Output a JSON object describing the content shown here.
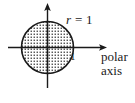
{
  "figure": {
    "name": "polar-circle-r-equals-1",
    "background_color": "#ffffff",
    "ink_color": "#1a1a1a",
    "labels": {
      "radius_label_variable": "r",
      "radius_label_equals": " = ",
      "radius_label_value": "1",
      "radius_label_full": "r = 1",
      "tick_label": "1",
      "axis_label_line1": "polar",
      "axis_label_line2": "axis"
    },
    "geometry": {
      "center_x": 47.5,
      "center_y": 47.5,
      "radius_px": 26.5,
      "radius_value": 1,
      "horizontal_axis_start_x": 8,
      "horizontal_axis_end_x": 107,
      "vertical_axis_top_y": 3,
      "vertical_axis_bottom_y": 88
    },
    "fill": {
      "style": "dot-stipple",
      "dot_color": "#1a1a1a",
      "dot_spacing_px": 3
    }
  }
}
